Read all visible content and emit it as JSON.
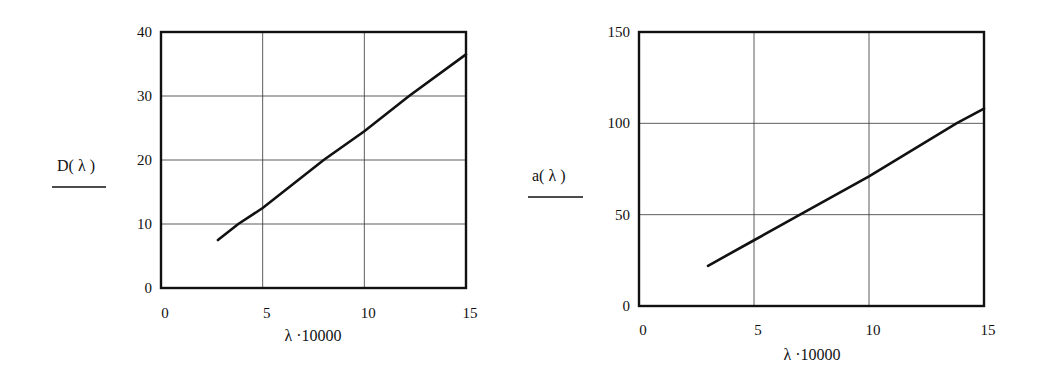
{
  "chart_data": [
    {
      "type": "line",
      "title": "",
      "xlabel": "λ·10000",
      "ylabel": "D(λ)",
      "xlim": [
        0,
        15
      ],
      "ylim": [
        0,
        40
      ],
      "xticks": [
        0,
        5,
        10,
        15
      ],
      "yticks": [
        0,
        10,
        20,
        30,
        40
      ],
      "grid": true,
      "legend": null,
      "series": [
        {
          "name": "D(λ)",
          "x": [
            2.8,
            3.8,
            5,
            8,
            10,
            12.2,
            15
          ],
          "y": [
            7.5,
            10,
            12.5,
            20,
            24.5,
            30,
            36.5
          ]
        }
      ]
    },
    {
      "type": "line",
      "title": "",
      "xlabel": "λ·10000",
      "ylabel": "a(λ)",
      "xlim": [
        0,
        15
      ],
      "ylim": [
        0,
        150
      ],
      "xticks": [
        0,
        5,
        10,
        15
      ],
      "yticks": [
        0,
        50,
        100,
        150
      ],
      "grid": true,
      "legend": null,
      "series": [
        {
          "name": "a(λ)",
          "x": [
            3,
            5,
            7,
            10,
            13.8,
            15
          ],
          "y": [
            22,
            36,
            50,
            71,
            100,
            108
          ]
        }
      ]
    }
  ],
  "charts": {
    "left": {
      "ylabel": "D( λ )",
      "xlabel": "λ ·10000",
      "ytick_labels": [
        "0",
        "10",
        "20",
        "30",
        "40"
      ],
      "xtick_labels": [
        "0",
        "5",
        "10",
        "15"
      ]
    },
    "right": {
      "ylabel": "a( λ )",
      "xlabel": "λ ·10000",
      "ytick_labels": [
        "0",
        "50",
        "100",
        "150"
      ],
      "xtick_labels": [
        "0",
        "5",
        "10",
        "15"
      ]
    }
  },
  "style": {
    "line_color": "#111111",
    "grid_color": "#333333",
    "background": "#ffffff"
  }
}
